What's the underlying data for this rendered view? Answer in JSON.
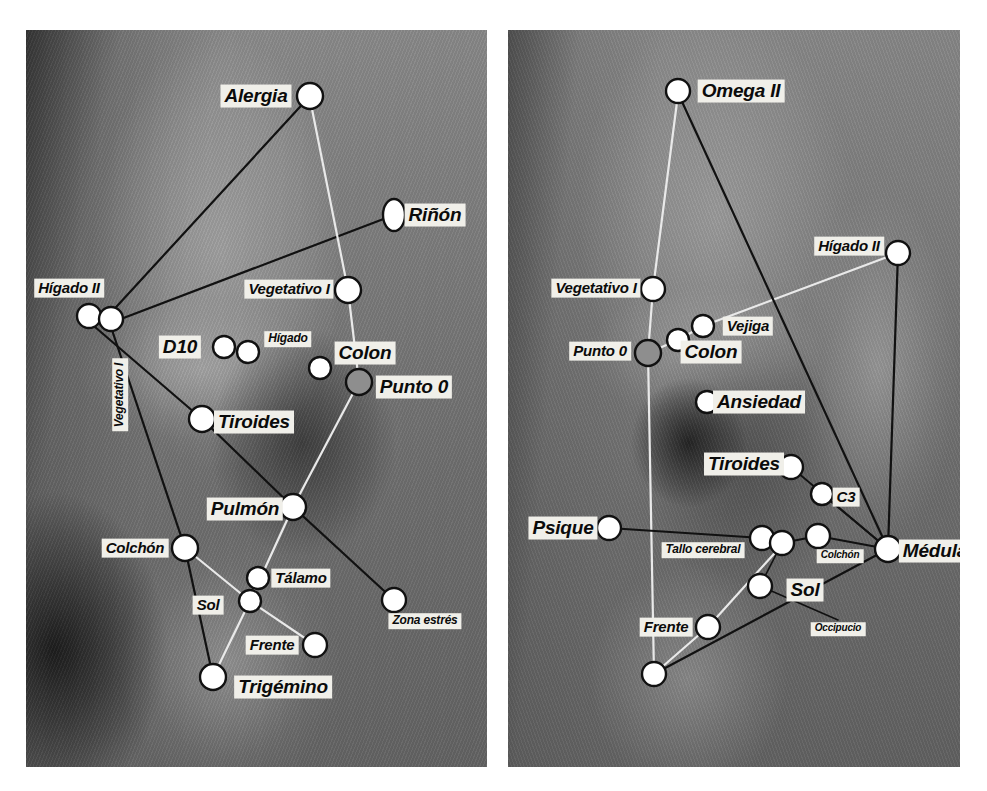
{
  "figure": {
    "panels": [
      {
        "id": "left-ear",
        "name": "left-ear-panel",
        "frame": {
          "x": 26,
          "y": 30,
          "w": 461,
          "h": 737
        },
        "points": [
          {
            "id": "alergia",
            "label": "Alergia",
            "cx": 310,
            "cy": 96,
            "r": 13,
            "shape": "circle",
            "fill": "#ffffff",
            "stroke": "#111111",
            "label_x": 256,
            "label_y": 96,
            "label_size": "lg"
          },
          {
            "id": "rinon",
            "label": "Riñón",
            "cx": 394,
            "cy": 215,
            "r": 13,
            "shape": "ellipse",
            "rx": 11,
            "ry": 16,
            "fill": "#ffffff",
            "stroke": "#111111",
            "label_x": 435,
            "label_y": 215,
            "label_size": "lg"
          },
          {
            "id": "higado2a",
            "label": "Hígado II",
            "cx": 89,
            "cy": 316,
            "r": 12,
            "shape": "circle",
            "fill": "#ffffff",
            "stroke": "#111111",
            "label_x": 69,
            "label_y": 288,
            "label_size": "md"
          },
          {
            "id": "higado2b",
            "label": "",
            "cx": 111,
            "cy": 319,
            "r": 12,
            "shape": "circle",
            "fill": "#ffffff",
            "stroke": "#111111"
          },
          {
            "id": "vegetativo1",
            "label": "Vegetativo I",
            "cx": 348,
            "cy": 290,
            "r": 13,
            "shape": "circle",
            "fill": "#ffffff",
            "stroke": "#111111",
            "label_x": 289,
            "label_y": 289,
            "label_size": "md"
          },
          {
            "id": "vegetativo1v",
            "label": "Vegetativo I",
            "cx": 0,
            "cy": 0,
            "r": 0,
            "shape": "none",
            "label_x": 120,
            "label_y": 395,
            "label_size": "sm",
            "vertical": true
          },
          {
            "id": "d10",
            "label": "D10",
            "cx": 224,
            "cy": 347,
            "r": 11,
            "shape": "circle",
            "fill": "#ffffff",
            "stroke": "#111111",
            "label_x": 180,
            "label_y": 347,
            "label_size": "lg"
          },
          {
            "id": "higado",
            "label": "Hígado",
            "cx": 248,
            "cy": 352,
            "r": 11,
            "shape": "circle",
            "fill": "#ffffff",
            "stroke": "#111111",
            "label_x": 288,
            "label_y": 339,
            "label_size": "sm"
          },
          {
            "id": "colon",
            "label": "Colon",
            "cx": 320,
            "cy": 368,
            "r": 11,
            "shape": "circle",
            "fill": "#ffffff",
            "stroke": "#111111",
            "label_x": 365,
            "label_y": 353,
            "label_size": "lg"
          },
          {
            "id": "punto0",
            "label": "Punto 0",
            "cx": 359,
            "cy": 382,
            "r": 13,
            "shape": "circle",
            "fill": "#8e8e8e",
            "stroke": "#111111",
            "label_x": 414,
            "label_y": 387,
            "label_size": "lg"
          },
          {
            "id": "tiroides",
            "label": "Tiroides",
            "cx": 202,
            "cy": 419,
            "r": 13,
            "shape": "circle",
            "fill": "#ffffff",
            "stroke": "#111111",
            "label_x": 254,
            "label_y": 422,
            "label_size": "lg"
          },
          {
            "id": "pulmon",
            "label": "Pulmón",
            "cx": 293,
            "cy": 507,
            "r": 13,
            "shape": "circle",
            "fill": "#ffffff",
            "stroke": "#111111",
            "label_x": 245,
            "label_y": 509,
            "label_size": "lg"
          },
          {
            "id": "colchon",
            "label": "Colchón",
            "cx": 185,
            "cy": 548,
            "r": 13,
            "shape": "circle",
            "fill": "#ffffff",
            "stroke": "#111111",
            "label_x": 135,
            "label_y": 548,
            "label_size": "md"
          },
          {
            "id": "talamo",
            "label": "Tálamo",
            "cx": 258,
            "cy": 578,
            "r": 11,
            "shape": "circle",
            "fill": "#ffffff",
            "stroke": "#111111",
            "label_x": 301,
            "label_y": 578,
            "label_size": "md"
          },
          {
            "id": "sol",
            "label": "Sol",
            "cx": 250,
            "cy": 601,
            "r": 11,
            "shape": "circle",
            "fill": "#ffffff",
            "stroke": "#111111",
            "label_x": 208,
            "label_y": 605,
            "label_size": "md"
          },
          {
            "id": "zonaestres",
            "label": "Zona estrés",
            "cx": 394,
            "cy": 600,
            "r": 12,
            "shape": "circle",
            "fill": "#ffffff",
            "stroke": "#111111",
            "label_x": 425,
            "label_y": 621,
            "label_size": "sm"
          },
          {
            "id": "frente",
            "label": "Frente",
            "cx": 315,
            "cy": 645,
            "r": 12,
            "shape": "circle",
            "fill": "#ffffff",
            "stroke": "#111111",
            "label_x": 272,
            "label_y": 645,
            "label_size": "md"
          },
          {
            "id": "trigemino",
            "label": "Trigémino",
            "cx": 213,
            "cy": 677,
            "r": 13,
            "shape": "circle",
            "fill": "#ffffff",
            "stroke": "#111111",
            "label_x": 283,
            "label_y": 687,
            "label_size": "lg"
          }
        ],
        "connectors": [
          {
            "from": [
              310,
              96
            ],
            "to": [
              107,
              317
            ],
            "color": "#111111",
            "width": 2.2
          },
          {
            "from": [
              394,
              215
            ],
            "to": [
              113,
              322
            ],
            "color": "#111111",
            "width": 2.2
          },
          {
            "from": [
              310,
              99
            ],
            "to": [
              348,
              290
            ],
            "color": "#e9e9e9",
            "width": 2.2
          },
          {
            "from": [
              348,
              290
            ],
            "to": [
              359,
              382
            ],
            "color": "#e9e9e9",
            "width": 2.2
          },
          {
            "from": [
              359,
              382
            ],
            "to": [
              293,
              507
            ],
            "color": "#e9e9e9",
            "width": 2.2
          },
          {
            "from": [
              293,
              507
            ],
            "to": [
              250,
              601
            ],
            "color": "#e9e9e9",
            "width": 2.2
          },
          {
            "from": [
              250,
              601
            ],
            "to": [
              213,
              677
            ],
            "color": "#e9e9e9",
            "width": 2.2
          },
          {
            "from": [
              185,
              548
            ],
            "to": [
              250,
              601
            ],
            "color": "#e9e9e9",
            "width": 2.2
          },
          {
            "from": [
              250,
              601
            ],
            "to": [
              315,
              645
            ],
            "color": "#e9e9e9",
            "width": 2.2
          },
          {
            "from": [
              95,
              327
            ],
            "to": [
              202,
              419
            ],
            "color": "#111111",
            "width": 2.2
          },
          {
            "from": [
              202,
              419
            ],
            "to": [
              293,
              507
            ],
            "color": "#111111",
            "width": 2.2
          },
          {
            "from": [
              293,
              507
            ],
            "to": [
              394,
              600
            ],
            "color": "#111111",
            "width": 2.2
          },
          {
            "from": [
              112,
              330
            ],
            "to": [
              185,
              548
            ],
            "color": "#111111",
            "width": 2.2
          },
          {
            "from": [
              185,
              548
            ],
            "to": [
              213,
              677
            ],
            "color": "#111111",
            "width": 2.2
          }
        ]
      },
      {
        "id": "right-ear",
        "name": "right-ear-panel",
        "frame": {
          "x": 508,
          "y": 30,
          "w": 452,
          "h": 737
        },
        "points": [
          {
            "id": "omega2",
            "label": "Omega II",
            "cx": 678,
            "cy": 91,
            "r": 12,
            "shape": "circle",
            "fill": "#ffffff",
            "stroke": "#111111",
            "label_x": 741,
            "label_y": 91,
            "label_size": "lg"
          },
          {
            "id": "higado2",
            "label": "Hígado II",
            "cx": 898,
            "cy": 253,
            "r": 12,
            "shape": "circle",
            "fill": "#ffffff",
            "stroke": "#111111",
            "label_x": 849,
            "label_y": 246,
            "label_size": "md"
          },
          {
            "id": "vegetativo1r",
            "label": "Vegetativo I",
            "cx": 653,
            "cy": 289,
            "r": 12,
            "shape": "circle",
            "fill": "#ffffff",
            "stroke": "#111111",
            "label_x": 596,
            "label_y": 288,
            "label_size": "md"
          },
          {
            "id": "vejiga",
            "label": "Vejiga",
            "cx": 703,
            "cy": 326,
            "r": 11,
            "shape": "circle",
            "fill": "#ffffff",
            "stroke": "#111111",
            "label_x": 748,
            "label_y": 326,
            "label_size": "md"
          },
          {
            "id": "colonr",
            "label": "Colon",
            "cx": 678,
            "cy": 340,
            "r": 11,
            "shape": "circle",
            "fill": "#ffffff",
            "stroke": "#111111",
            "label_x": 711,
            "label_y": 352,
            "label_size": "lg"
          },
          {
            "id": "punto0r",
            "label": "Punto 0",
            "cx": 648,
            "cy": 353,
            "r": 13,
            "shape": "circle",
            "fill": "#8e8e8e",
            "stroke": "#111111",
            "label_x": 600,
            "label_y": 351,
            "label_size": "md"
          },
          {
            "id": "ansiedad",
            "label": "Ansiedad",
            "cx": 707,
            "cy": 402,
            "r": 11,
            "shape": "circle",
            "fill": "#ffffff",
            "stroke": "#111111",
            "label_x": 759,
            "label_y": 402,
            "label_size": "lg"
          },
          {
            "id": "tiroidesr",
            "label": "Tiroides",
            "cx": 791,
            "cy": 467,
            "r": 12,
            "shape": "circle",
            "fill": "#ffffff",
            "stroke": "#111111",
            "label_x": 744,
            "label_y": 464,
            "label_size": "lg"
          },
          {
            "id": "c3",
            "label": "C3",
            "cx": 822,
            "cy": 494,
            "r": 11,
            "shape": "circle",
            "fill": "#ffffff",
            "stroke": "#111111",
            "label_x": 846,
            "label_y": 497,
            "label_size": "md"
          },
          {
            "id": "psique",
            "label": "Psique",
            "cx": 609,
            "cy": 528,
            "r": 12,
            "shape": "circle",
            "fill": "#ffffff",
            "stroke": "#111111",
            "label_x": 563,
            "label_y": 528,
            "label_size": "lg"
          },
          {
            "id": "tallo1",
            "label": "Tallo cerebral",
            "cx": 762,
            "cy": 538,
            "r": 12,
            "shape": "circle",
            "fill": "#ffffff",
            "stroke": "#111111",
            "label_x": 703,
            "label_y": 550,
            "label_size": "sm"
          },
          {
            "id": "tallo2",
            "label": "",
            "cx": 782,
            "cy": 543,
            "r": 12,
            "shape": "circle",
            "fill": "#ffffff",
            "stroke": "#111111"
          },
          {
            "id": "colchonr",
            "label": "Colchón",
            "cx": 818,
            "cy": 536,
            "r": 12,
            "shape": "circle",
            "fill": "#ffffff",
            "stroke": "#111111",
            "label_x": 840,
            "label_y": 556,
            "label_size": "xs"
          },
          {
            "id": "medula",
            "label": "Médula",
            "cx": 888,
            "cy": 549,
            "r": 13,
            "shape": "circle",
            "fill": "#ffffff",
            "stroke": "#111111",
            "label_x": 935,
            "label_y": 551,
            "label_size": "lg"
          },
          {
            "id": "solr",
            "label": "Sol",
            "cx": 760,
            "cy": 586,
            "r": 12,
            "shape": "circle",
            "fill": "#ffffff",
            "stroke": "#111111",
            "label_x": 805,
            "label_y": 590,
            "label_size": "lg"
          },
          {
            "id": "occipucio",
            "label": "Occipucio",
            "cx": 0,
            "cy": 0,
            "r": 0,
            "shape": "none",
            "label_x": 838,
            "label_y": 629,
            "label_size": "xs"
          },
          {
            "id": "frenter",
            "label": "Frente",
            "cx": 708,
            "cy": 627,
            "r": 12,
            "shape": "circle",
            "fill": "#ffffff",
            "stroke": "#111111",
            "label_x": 666,
            "label_y": 627,
            "label_size": "md"
          },
          {
            "id": "lobulo",
            "label": "",
            "cx": 654,
            "cy": 674,
            "r": 12,
            "shape": "circle",
            "fill": "#ffffff",
            "stroke": "#111111"
          }
        ],
        "connectors": [
          {
            "from": [
              678,
              94
            ],
            "to": [
              653,
              289
            ],
            "color": "#e9e9e9",
            "width": 2.2
          },
          {
            "from": [
              653,
              289
            ],
            "to": [
              648,
              353
            ],
            "color": "#e9e9e9",
            "width": 2.2
          },
          {
            "from": [
              648,
              353
            ],
            "to": [
              678,
              340
            ],
            "color": "#e9e9e9",
            "width": 2.2
          },
          {
            "from": [
              678,
              340
            ],
            "to": [
              703,
              326
            ],
            "color": "#e9e9e9",
            "width": 2.2
          },
          {
            "from": [
              703,
              326
            ],
            "to": [
              898,
              253
            ],
            "color": "#e9e9e9",
            "width": 2.2
          },
          {
            "from": [
              648,
              353
            ],
            "to": [
              654,
              674
            ],
            "color": "#e9e9e9",
            "width": 2.2
          },
          {
            "from": [
              678,
              93
            ],
            "to": [
              888,
              549
            ],
            "color": "#111111",
            "width": 2.2
          },
          {
            "from": [
              898,
              253
            ],
            "to": [
              888,
              549
            ],
            "color": "#111111",
            "width": 2.2
          },
          {
            "from": [
              609,
              528
            ],
            "to": [
              762,
              538
            ],
            "color": "#111111",
            "width": 2.2
          },
          {
            "from": [
              782,
              543
            ],
            "to": [
              818,
              536
            ],
            "color": "#111111",
            "width": 2.2
          },
          {
            "from": [
              818,
              536
            ],
            "to": [
              888,
              549
            ],
            "color": "#111111",
            "width": 2.2
          },
          {
            "from": [
              791,
              467
            ],
            "to": [
              888,
              549
            ],
            "color": "#111111",
            "width": 1.8
          },
          {
            "from": [
              822,
              494
            ],
            "to": [
              888,
              549
            ],
            "color": "#111111",
            "width": 1.8
          },
          {
            "from": [
              888,
              549
            ],
            "to": [
              654,
              674
            ],
            "color": "#111111",
            "width": 2.2
          },
          {
            "from": [
              782,
              543
            ],
            "to": [
              760,
              586
            ],
            "color": "#111111",
            "width": 1.6
          },
          {
            "from": [
              782,
              545
            ],
            "to": [
              708,
              627
            ],
            "color": "#e9e9e9",
            "width": 2.2
          },
          {
            "from": [
              708,
              627
            ],
            "to": [
              654,
              674
            ],
            "color": "#e9e9e9",
            "width": 2.2
          },
          {
            "from": [
              760,
              586
            ],
            "to": [
              838,
              620
            ],
            "color": "#111111",
            "width": 1.6
          }
        ]
      }
    ]
  }
}
